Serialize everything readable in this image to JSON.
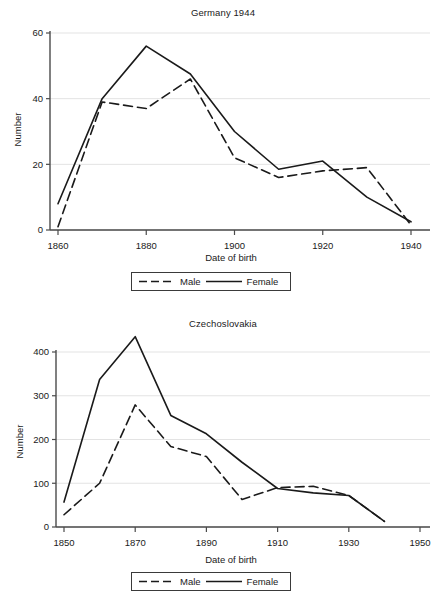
{
  "figure": {
    "axis_label_x": "Date of birth",
    "axis_label_y": "Number"
  },
  "legend": {
    "male_label": "Male",
    "female_label": "Female",
    "male_style": "dashed",
    "female_style": "solid",
    "line_color": "#1a1a1a",
    "position": "below-axis-center"
  },
  "chart_data": [
    {
      "type": "line",
      "title": "Germany 1944",
      "xlabel": "Date of birth",
      "ylabel": "Number",
      "xlim": [
        1858,
        1942
      ],
      "ylim": [
        0,
        62
      ],
      "xticks": [
        1860,
        1880,
        1900,
        1920,
        1940
      ],
      "yticks": [
        0,
        20,
        40,
        60
      ],
      "xtick_labels": [
        "1860",
        "1880",
        "1900",
        "1920",
        "1940"
      ],
      "ytick_labels": [
        "0",
        "20",
        "40",
        "60"
      ],
      "grid": "horizontal",
      "x": [
        1860,
        1870,
        1880,
        1890,
        1900,
        1910,
        1920,
        1930,
        1940
      ],
      "series": [
        {
          "name": "Male",
          "style": "dashed",
          "values": [
            1,
            39,
            37,
            46,
            22,
            16,
            18,
            19,
            1.5
          ]
        },
        {
          "name": "Female",
          "style": "solid",
          "values": [
            8,
            40,
            56,
            47.5,
            30,
            18.5,
            21,
            10,
            2.5
          ]
        }
      ]
    },
    {
      "type": "line",
      "title": "Czechoslovakia",
      "xlabel": "Date of birth",
      "ylabel": "Number",
      "xlim": [
        1848,
        1952
      ],
      "ylim": [
        0,
        450
      ],
      "xticks": [
        1850,
        1870,
        1890,
        1910,
        1930,
        1950
      ],
      "yticks": [
        0,
        100,
        200,
        300,
        400
      ],
      "xtick_labels": [
        "1850",
        "1870",
        "1890",
        "1910",
        "1930",
        "1950"
      ],
      "ytick_labels": [
        "0",
        "100",
        "200",
        "300",
        "400"
      ],
      "grid": "horizontal",
      "x": [
        1850,
        1860,
        1870,
        1880,
        1890,
        1900,
        1910,
        1920,
        1930,
        1940
      ],
      "series": [
        {
          "name": "Male",
          "style": "dashed",
          "values": [
            28,
            100,
            279,
            184,
            161,
            63,
            90,
            93,
            72,
            13
          ]
        },
        {
          "name": "Female",
          "style": "solid",
          "values": [
            57,
            337,
            435,
            255,
            213,
            148,
            88,
            78,
            72,
            13
          ]
        }
      ]
    }
  ]
}
